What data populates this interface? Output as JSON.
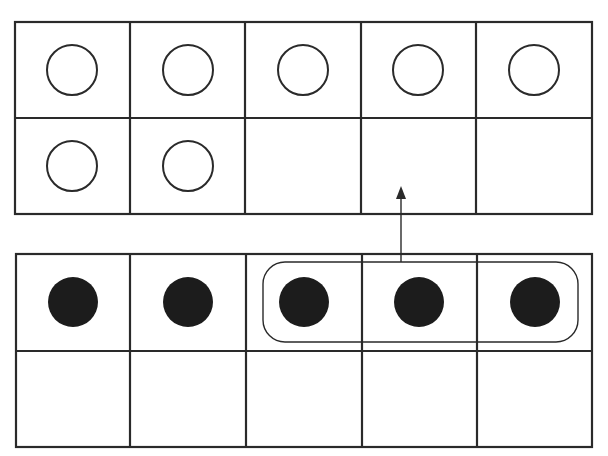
{
  "diagram": {
    "colors": {
      "line": "#2a2a2a",
      "fill": "#1c1c1c",
      "background": "#ffffff"
    },
    "top_frame": {
      "rows": 2,
      "cols": 5,
      "counters": [
        [
          true,
          true,
          true,
          true,
          true
        ],
        [
          true,
          true,
          false,
          false,
          false
        ]
      ],
      "counter_style": "open-circle",
      "count": 7
    },
    "bottom_frame": {
      "rows": 2,
      "cols": 5,
      "counters": [
        [
          true,
          true,
          true,
          true,
          true
        ],
        [
          false,
          false,
          false,
          false,
          false
        ]
      ],
      "counter_style": "filled-dot",
      "count": 5,
      "grouped_cells": [
        2,
        3,
        4
      ]
    },
    "arrow": {
      "from": "bottom_frame.group",
      "to": "top_frame.row2.col4",
      "direction": "up"
    }
  }
}
